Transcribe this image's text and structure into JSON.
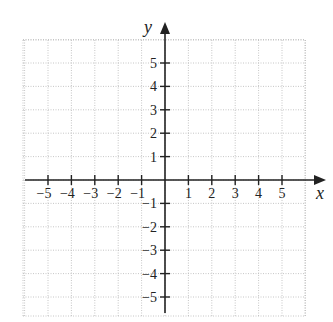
{
  "figure": {
    "type": "cartesian-coordinate-grid",
    "x_axis": {
      "label": "x",
      "ticks": [
        -5,
        -4,
        -3,
        -2,
        -1,
        1,
        2,
        3,
        4,
        5
      ],
      "range": [
        -6,
        6
      ]
    },
    "y_axis": {
      "label": "y",
      "ticks": [
        5,
        4,
        3,
        2,
        1,
        -1,
        -2,
        -3,
        -4,
        -5
      ],
      "range": [
        -6,
        6
      ]
    },
    "grid": {
      "style": "dotted",
      "color": "#b8b8b8"
    },
    "axis_color": "#222222"
  }
}
